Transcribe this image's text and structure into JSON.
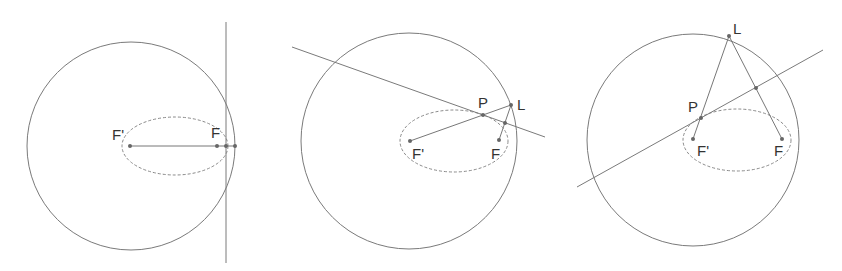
{
  "panels": [
    {
      "id": "panel-1",
      "description": "Tangent line perpendicular to major axis at vertex",
      "labels": {
        "f_prime": "F'",
        "f": "F"
      }
    },
    {
      "id": "panel-2",
      "description": "Tangent line through P with reflection point L near focus",
      "labels": {
        "p": "P",
        "l": "L",
        "f_prime": "F'",
        "f": "F"
      }
    },
    {
      "id": "panel-3",
      "description": "Tangent line through P with point L on the director circle",
      "labels": {
        "l": "L",
        "p": "P",
        "f_prime": "F'",
        "f": "F"
      }
    }
  ],
  "colors": {
    "stroke": "#7a7a7a",
    "point": "#666666",
    "label": "#333333",
    "background": "#ffffff"
  }
}
